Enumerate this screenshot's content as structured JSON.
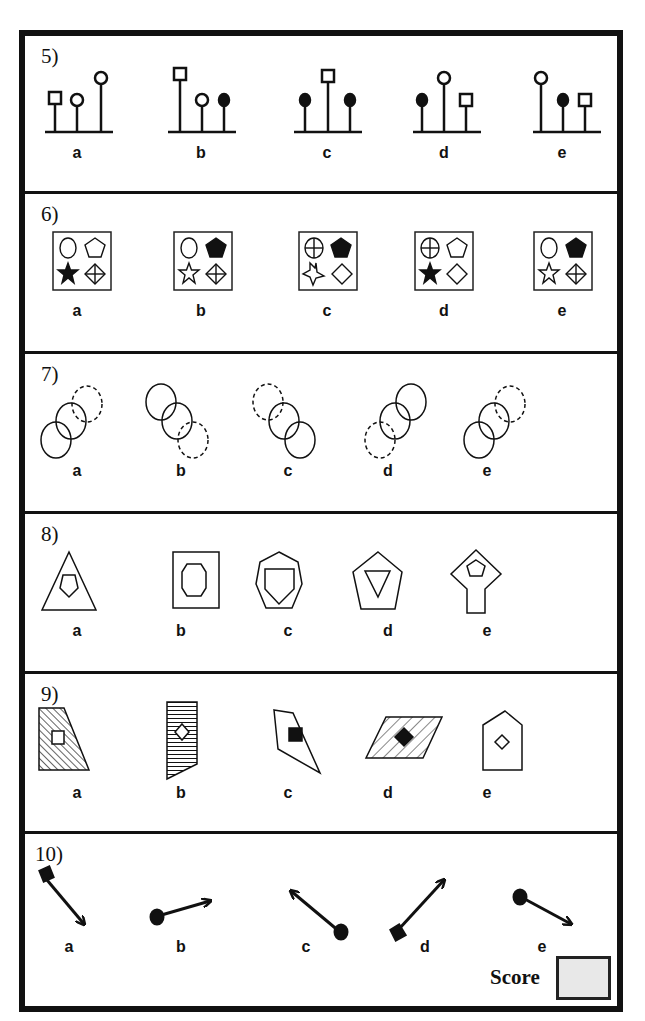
{
  "worksheet": {
    "questions": [
      {
        "number": "5)",
        "options": [
          "a",
          "b",
          "c",
          "d",
          "e"
        ],
        "description": "stems with square/circle/filled-dot heads on base line"
      },
      {
        "number": "6)",
        "options": [
          "a",
          "b",
          "c",
          "d",
          "e"
        ],
        "description": "boxes containing circle, pentagon, star, diamond variants"
      },
      {
        "number": "7)",
        "options": [
          "a",
          "b",
          "c",
          "d",
          "e"
        ],
        "description": "three overlapping circles, one dashed"
      },
      {
        "number": "8)",
        "options": [
          "a",
          "b",
          "c",
          "d",
          "e"
        ],
        "description": "polygon inside polygon"
      },
      {
        "number": "9)",
        "options": [
          "a",
          "b",
          "c",
          "d",
          "e"
        ],
        "description": "hatched quadrilaterals with inner shape"
      },
      {
        "number": "10)",
        "options": [
          "a",
          "b",
          "c",
          "d",
          "e"
        ],
        "description": "arrows with circle or diamond tail"
      }
    ],
    "score": {
      "label": "Score",
      "value": ""
    }
  },
  "colors": {
    "ink": "#111111",
    "score_box_fill": "#e8e8e8",
    "background": "#ffffff"
  }
}
